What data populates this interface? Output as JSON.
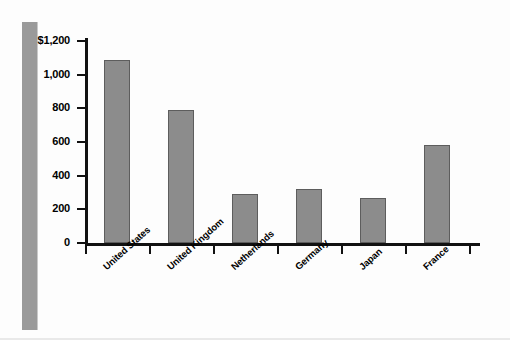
{
  "figure": {
    "background_color": "#fdfdfd",
    "bar_color": "#8c8c8c",
    "bar_edge_color": "#5d5d5d",
    "axis_color": "#111111",
    "left_band_color": "#9a9a9a"
  },
  "chart_data": {
    "type": "bar",
    "title": "",
    "subtitle": "",
    "xlabel": "",
    "ylabel": "",
    "categories": [
      "United States",
      "United Kingdom",
      "Netherlands",
      "Germany",
      "Japan",
      "France"
    ],
    "values": [
      1090,
      790,
      290,
      320,
      270,
      585
    ],
    "ylim": [
      0,
      1200
    ],
    "ytick_values": [
      0,
      200,
      400,
      600,
      800,
      1000,
      1200
    ],
    "ytick_labels": [
      "0",
      "200",
      "400",
      "600",
      "800",
      "1,000",
      "$1,200"
    ],
    "grid": false,
    "legend": null,
    "annotations": []
  }
}
